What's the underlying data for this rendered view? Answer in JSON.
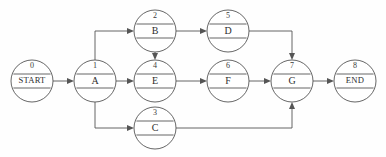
{
  "diagram": {
    "type": "directed-graph",
    "canvas": {
      "width": 386,
      "height": 157
    },
    "style": {
      "node_shape": "circle-with-two-horizontal-dividers",
      "stroke_color": "#555555",
      "fill_color": "#ffffff",
      "background_color": "#fefefe",
      "text_color": "#2e2e2e"
    },
    "nodes": [
      {
        "key": "start",
        "id": "0",
        "label": "START",
        "cx": 32,
        "cy": 81,
        "r": 21,
        "label_size": "small"
      },
      {
        "key": "a",
        "id": "1",
        "label": "A",
        "cx": 95,
        "cy": 81,
        "r": 21,
        "label_size": "normal"
      },
      {
        "key": "b",
        "id": "2",
        "label": "B",
        "cx": 155,
        "cy": 31,
        "r": 21,
        "label_size": "normal"
      },
      {
        "key": "e",
        "id": "4",
        "label": "E",
        "cx": 155,
        "cy": 81,
        "r": 21,
        "label_size": "normal"
      },
      {
        "key": "c",
        "id": "3",
        "label": "C",
        "cx": 155,
        "cy": 128,
        "r": 21,
        "label_size": "normal"
      },
      {
        "key": "d",
        "id": "5",
        "label": "D",
        "cx": 228,
        "cy": 31,
        "r": 21,
        "label_size": "normal"
      },
      {
        "key": "f",
        "id": "6",
        "label": "F",
        "cx": 228,
        "cy": 81,
        "r": 21,
        "label_size": "normal"
      },
      {
        "key": "g",
        "id": "7",
        "label": "G",
        "cx": 292,
        "cy": 81,
        "r": 21,
        "label_size": "normal"
      },
      {
        "key": "end",
        "id": "8",
        "label": "END",
        "cx": 355,
        "cy": 81,
        "r": 21,
        "label_size": "small"
      }
    ],
    "edges": [
      {
        "from": "start",
        "to": "a",
        "route": "straight"
      },
      {
        "from": "a",
        "to": "b",
        "route": "up-then-right"
      },
      {
        "from": "a",
        "to": "e",
        "route": "straight"
      },
      {
        "from": "a",
        "to": "c",
        "route": "down-then-right"
      },
      {
        "from": "b",
        "to": "d",
        "route": "straight"
      },
      {
        "from": "b",
        "to": "e",
        "route": "straight-down"
      },
      {
        "from": "d",
        "to": "g",
        "route": "right-then-down"
      },
      {
        "from": "e",
        "to": "f",
        "route": "straight"
      },
      {
        "from": "f",
        "to": "g",
        "route": "straight"
      },
      {
        "from": "c",
        "to": "g",
        "route": "right-then-up"
      },
      {
        "from": "g",
        "to": "end",
        "route": "straight"
      }
    ]
  }
}
